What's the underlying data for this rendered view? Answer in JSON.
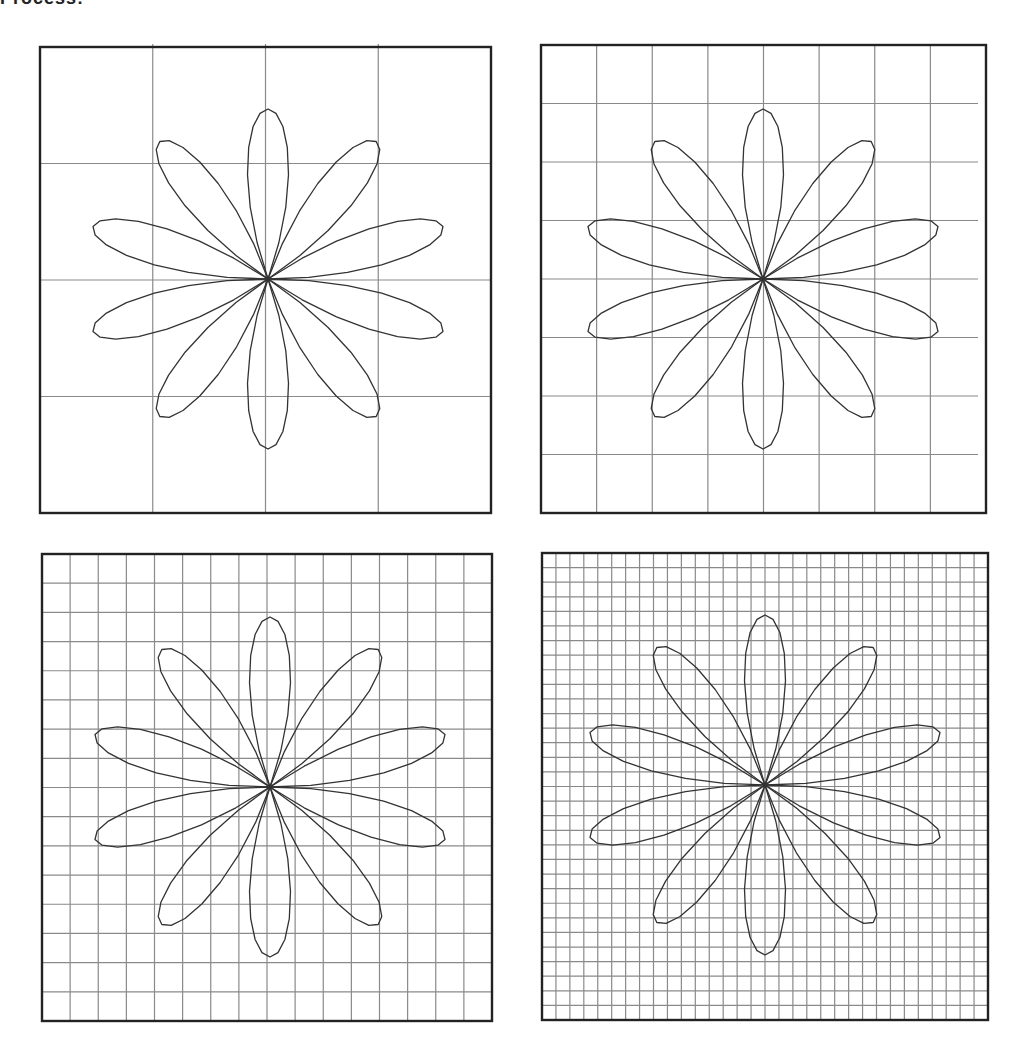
{
  "header": {
    "cut_text": "Process:"
  },
  "style": {
    "frame_color": "#222222",
    "grid_color": "#8a8a8a",
    "curve_color": "#333333",
    "background": "#ffffff"
  },
  "rose": {
    "petals": 10,
    "first_peak_deg": 18,
    "rx": 184,
    "ry": 170,
    "samples_per_petal": 14
  },
  "panels": [
    {
      "id": "panel-grid-4",
      "x": 40,
      "y": 47,
      "w": 451,
      "h": 466,
      "grid": 4,
      "cx": 268,
      "cy": 279
    },
    {
      "id": "panel-grid-8",
      "x": 541,
      "y": 45,
      "w": 445,
      "h": 468,
      "grid": 8,
      "cx": 763,
      "cy": 279
    },
    {
      "id": "panel-grid-16",
      "x": 42,
      "y": 554,
      "w": 450,
      "h": 467,
      "grid": 16,
      "cx": 270,
      "cy": 787
    },
    {
      "id": "panel-grid-32",
      "x": 542,
      "y": 553,
      "w": 446,
      "h": 467,
      "grid": 32,
      "cx": 765,
      "cy": 785
    }
  ]
}
